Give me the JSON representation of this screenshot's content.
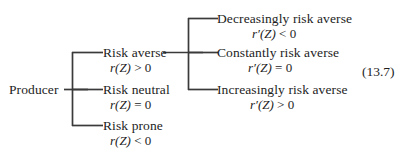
{
  "figure": {
    "equation_number": "(13.7)",
    "root": {
      "label": "Producer"
    },
    "branches": [
      {
        "label": "Risk averse",
        "condition_fn": "r",
        "condition_arg": "(Z)",
        "condition_rel": " > 0",
        "condition_full": "r(Z) > 0"
      },
      {
        "label": "Risk neutral",
        "condition_fn": "r",
        "condition_arg": "(Z)",
        "condition_rel": " = 0",
        "condition_full": "r(Z) = 0"
      },
      {
        "label": "Risk prone",
        "condition_fn": "r",
        "condition_arg": "(Z)",
        "condition_rel": " < 0",
        "condition_full": "r(Z) < 0"
      }
    ],
    "subbranches": [
      {
        "label": "Decreasingly risk averse",
        "condition_fn": "r′",
        "condition_arg": "(Z)",
        "condition_rel": " < 0",
        "condition_full": "r′(Z) < 0"
      },
      {
        "label": "Constantly risk averse",
        "condition_fn": "r′",
        "condition_arg": "(Z)",
        "condition_rel": " = 0",
        "condition_full": "r′(Z) = 0"
      },
      {
        "label": "Increasingly risk averse",
        "condition_fn": "r′",
        "condition_arg": "(Z)",
        "condition_rel": " > 0",
        "condition_full": "r′(Z) > 0"
      }
    ],
    "colors": {
      "text": "#1d1d1d",
      "line": "#3a3a3a",
      "background": "#ffffff"
    }
  }
}
